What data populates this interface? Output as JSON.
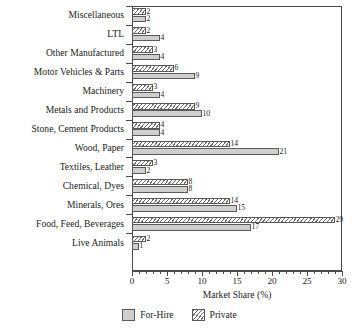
{
  "chart_data": {
    "type": "bar",
    "orientation": "horizontal",
    "title": "",
    "xlabel": "Market Share (%)",
    "ylabel": "",
    "xlim": [
      0,
      30
    ],
    "xticks": [
      0,
      5,
      10,
      15,
      20,
      25,
      30
    ],
    "xtick_labels": [
      "0",
      "5",
      "10",
      "15",
      "20",
      "25",
      "30"
    ],
    "minor_tick_step": 1,
    "grid": false,
    "legend_position": "bottom-center",
    "categories": [
      "Miscellaneous",
      "LTL",
      "Other Manufactured",
      "Motor Vehicles & Parts",
      "Machinery",
      "Metals and Products",
      "Stone, Cement Products",
      "Wood, Paper",
      "Textiles, Leather",
      "Chemical, Dyes",
      "Minerals, Ores",
      "Food, Feed, Beverages",
      "Live Animals"
    ],
    "series": [
      {
        "name": "Private",
        "color": "#ffffff",
        "pattern": "diagonal-hatch",
        "values": [
          2,
          2,
          3,
          6,
          3,
          9,
          4,
          14,
          3,
          8,
          14,
          29,
          2
        ]
      },
      {
        "name": "For-Hire",
        "color": "#cfcfcf",
        "pattern": "solid",
        "values": [
          2,
          4,
          4,
          9,
          4,
          10,
          4,
          21,
          2,
          8,
          15,
          17,
          1
        ]
      }
    ]
  },
  "legend": {
    "items": [
      {
        "label": "For-Hire",
        "style": "forhire"
      },
      {
        "label": "Private",
        "style": "private"
      }
    ]
  }
}
